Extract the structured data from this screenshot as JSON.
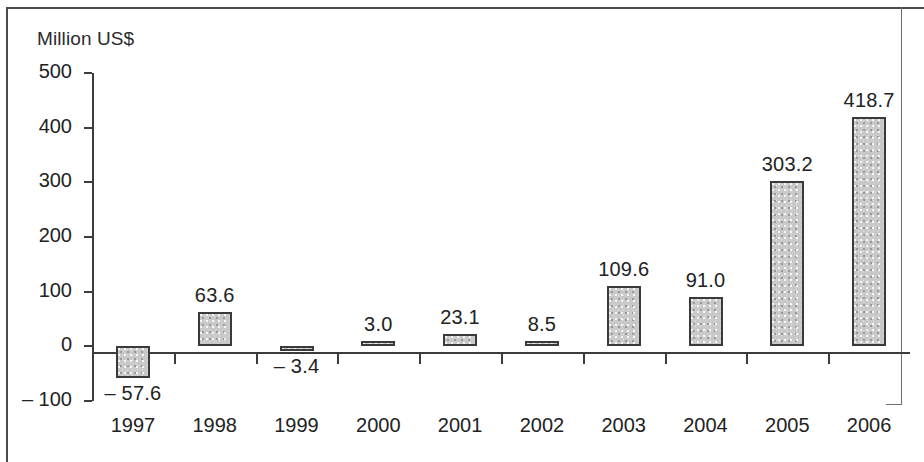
{
  "chart_data": {
    "type": "bar",
    "title": "",
    "subtitle": "",
    "xlabel": "",
    "ylabel": "Million US$",
    "categories": [
      "1997",
      "1998",
      "1999",
      "2000",
      "2001",
      "2002",
      "2003",
      "2004",
      "2005",
      "2006"
    ],
    "values": [
      -57.6,
      63.6,
      -3.4,
      3.0,
      23.1,
      8.5,
      109.6,
      91.0,
      303.2,
      418.7
    ],
    "value_labels": [
      "– 57.6",
      "63.6",
      "– 3.4",
      "3.0",
      "23.1",
      "8.5",
      "109.6",
      "91.0",
      "303.2",
      "418.7"
    ],
    "series": [
      {
        "name": "Million US$",
        "values": [
          -57.6,
          63.6,
          -3.4,
          3.0,
          23.1,
          8.5,
          109.6,
          91.0,
          303.2,
          418.7
        ]
      }
    ],
    "ylim": [
      -100,
      500
    ],
    "yticks": [
      500,
      400,
      300,
      200,
      100,
      0,
      -100
    ],
    "ytick_labels": [
      "500",
      "400",
      "300",
      "200",
      "100",
      "0",
      "– 100"
    ],
    "grid": false,
    "legend": null,
    "legend_position": "none",
    "bar_fill_color": "#c9c9c9",
    "bar_border_color": "#3a3a3a",
    "axis_color": "#3c3c3c",
    "frame_color": "#4a4a4a",
    "text_color": "#222222"
  },
  "axis_title": "Million US$"
}
